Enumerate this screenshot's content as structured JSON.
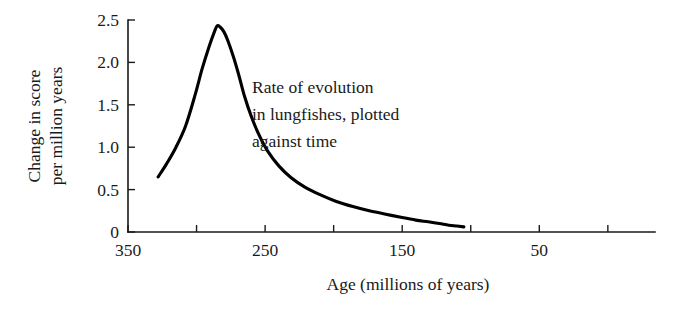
{
  "chart_data": {
    "type": "line",
    "title": "",
    "subtitle": "",
    "xlabel": "Age (millions of years)",
    "ylabel": "Change in score per million years",
    "ylabel_lines": [
      "Change in score",
      "per million years"
    ],
    "xlim": [
      350,
      0
    ],
    "ylim": [
      0,
      2.5
    ],
    "x_axis_reversed": true,
    "grid": false,
    "legend": null,
    "legend_position": "none",
    "xticks": [
      350,
      300,
      250,
      200,
      150,
      100,
      50,
      0
    ],
    "xtick_labels": [
      "350",
      "",
      "250",
      "",
      "150",
      "",
      "50",
      ""
    ],
    "yticks": [
      0,
      0.5,
      1.0,
      1.5,
      2.0,
      2.5
    ],
    "ytick_labels": [
      "0",
      "0.5",
      "1.0",
      "1.5",
      "2.0",
      "2.5"
    ],
    "annotations": [
      {
        "name": "curve-caption",
        "lines": [
          "Rate of evolution",
          "in lungfishes, plotted",
          "against time"
        ],
        "x": 252,
        "y": 0
      }
    ],
    "series": [
      {
        "name": "Rate of evolution in lungfishes",
        "color": "#000000",
        "x": [
          328,
          322,
          315,
          308,
          301,
          296,
          291,
          287,
          285,
          283,
          280,
          277,
          273,
          269,
          265,
          260,
          254,
          248,
          240,
          231,
          221,
          210,
          198,
          186,
          174,
          162,
          150,
          140,
          131,
          123,
          116,
          110,
          105
        ],
        "y": [
          0.65,
          0.8,
          1.0,
          1.25,
          1.62,
          1.92,
          2.18,
          2.36,
          2.43,
          2.42,
          2.36,
          2.25,
          2.06,
          1.84,
          1.6,
          1.36,
          1.13,
          0.95,
          0.78,
          0.64,
          0.53,
          0.44,
          0.36,
          0.3,
          0.25,
          0.21,
          0.17,
          0.14,
          0.12,
          0.1,
          0.08,
          0.07,
          0.06
        ]
      }
    ]
  },
  "geometry": {
    "plot_left_px": 128,
    "plot_right_px": 655,
    "plot_bottom_px": 232,
    "plot_top_px": 20,
    "x_per_unit_px": 1.371,
    "tick_len_px": 7
  }
}
